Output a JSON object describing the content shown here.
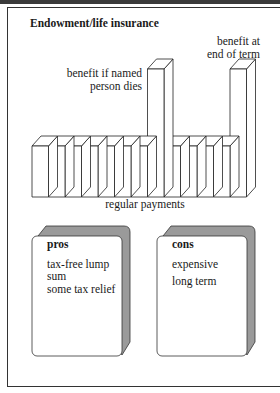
{
  "title": "Endowment/life insurance",
  "labels": {
    "death_benefit": "benefit if named person dies",
    "term_benefit": "benefit at end of term",
    "regular_payments": "regular payments"
  },
  "diagram": {
    "regular_payment_blocks_left": 7,
    "regular_payment_blocks_right": 4,
    "tall_bars": [
      "death_benefit",
      "term_benefit"
    ]
  },
  "pros": {
    "title": "pros",
    "items": [
      "tax-free lump sum",
      "some tax relief"
    ]
  },
  "cons": {
    "title": "cons",
    "items": [
      "expensive",
      "long term"
    ]
  }
}
